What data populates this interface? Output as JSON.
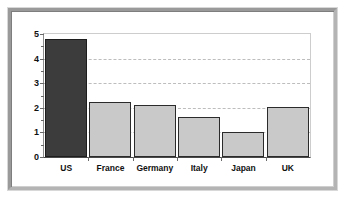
{
  "chart_data": {
    "type": "bar",
    "title": "",
    "subtitle": "",
    "xlabel": "",
    "ylabel": "",
    "categories": [
      "US",
      "France",
      "Germany",
      "Italy",
      "Japan",
      "UK"
    ],
    "values": [
      4.8,
      2.22,
      2.12,
      1.62,
      1.02,
      2.05
    ],
    "series": [
      {
        "name": "",
        "values": [
          4.8,
          2.22,
          2.12,
          1.62,
          1.02,
          2.05
        ]
      }
    ],
    "ylim": [
      0,
      5
    ],
    "xlim_categories": 6,
    "y_major_ticks": [
      0,
      1,
      2,
      3,
      4,
      5
    ],
    "y_tick_labels": [
      "0",
      "1",
      "2",
      "3",
      "4",
      "5"
    ],
    "y_minor_ticks": [
      0.5,
      1.5,
      2.5,
      3.5,
      4.5
    ],
    "gridlines": [
      1,
      2,
      3,
      4
    ],
    "grid": true,
    "grid_style": "dashed",
    "legend": false,
    "legend_position": "none",
    "annotations": [],
    "bar_colors": [
      "#3c3c3c",
      "#c9c9c9",
      "#c9c9c9",
      "#c9c9c9",
      "#c9c9c9",
      "#c9c9c9"
    ],
    "highlight_category": "US"
  },
  "colors": {
    "bar_highlight": "#3c3c3c",
    "bar_default": "#c9c9c9",
    "bar_outline": "#2b2b2b",
    "gridline": "#bdbdbd",
    "axis": "#4a4a4a",
    "plot_background": "#ffffff",
    "page_background": "#ffffff",
    "frame_light": "#b4b4b4",
    "frame_dark": "#9a9a9a",
    "text": "#111111"
  }
}
